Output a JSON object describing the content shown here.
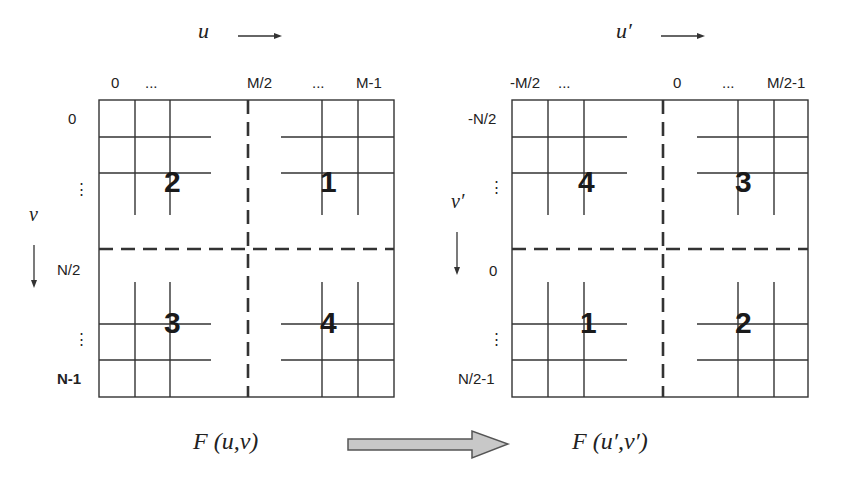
{
  "left_panel": {
    "axis_u_label": "u",
    "axis_v_label": "ν",
    "top_ticks": [
      "0",
      "...",
      "M/2",
      "...",
      "M-1"
    ],
    "side_ticks": [
      "0",
      "⋮",
      "N/2",
      "⋮",
      "N-1"
    ],
    "quadrants": {
      "top_left": "2",
      "top_right": "1",
      "bottom_left": "3",
      "bottom_right": "4"
    },
    "caption": "F (u,ν)"
  },
  "right_panel": {
    "axis_u_label": "u′",
    "axis_v_label": "ν′",
    "top_ticks": [
      "-M/2",
      "...",
      "0",
      "...",
      "M/2-1"
    ],
    "side_ticks": [
      "-N/2",
      "⋮",
      "0",
      "⋮",
      "N/2-1"
    ],
    "quadrants": {
      "top_left": "4",
      "top_right": "3",
      "bottom_left": "1",
      "bottom_right": "2"
    },
    "caption": "F (u′,ν′)"
  },
  "transform_arrow": {
    "fill": "#c8c8c8",
    "stroke": "#555555"
  },
  "colors": {
    "line": "#333333",
    "background": "#ffffff"
  }
}
